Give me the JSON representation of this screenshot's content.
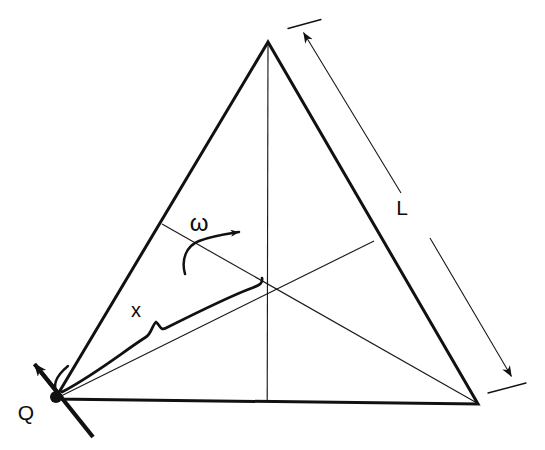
{
  "figure": {
    "background_color": "#ffffff",
    "ink_color": "#111111",
    "canvas": {
      "width": 545,
      "height": 450
    }
  },
  "labels": {
    "side_length": "L",
    "radial_distance": "x",
    "pivot_point": "Q",
    "angular_velocity": "ω"
  },
  "label_positions": {
    "side_length": {
      "x": 402,
      "y": 215
    },
    "radial_distance": {
      "x": 136,
      "y": 317
    },
    "pivot_point": {
      "x": 26,
      "y": 420
    },
    "angular_velocity": {
      "x": 199,
      "y": 231
    }
  },
  "geometry": {
    "triangle": {
      "name": "equilateral-plate",
      "stroke_width": 3.0,
      "vertices": [
        {
          "name": "apex",
          "x": 268,
          "y": 42
        },
        {
          "name": "bottom-left",
          "x": 55,
          "y": 399
        },
        {
          "name": "bottom-right",
          "x": 478,
          "y": 404
        }
      ]
    },
    "medians": {
      "stroke_width": 1.0,
      "centroid": {
        "x": 267,
        "y": 282
      },
      "lines": [
        {
          "name": "median-apex-to-base",
          "x1": 268,
          "y1": 42,
          "x2": 267,
          "y2": 401
        },
        {
          "name": "median-q-to-right",
          "x1": 55,
          "y1": 399,
          "x2": 374,
          "y2": 241
        },
        {
          "name": "median-left-to-right",
          "x1": 162,
          "y1": 224,
          "x2": 478,
          "y2": 404
        }
      ]
    },
    "pivot_marker": {
      "name": "pivot-dot",
      "x": 56,
      "y": 397,
      "radius": 6
    },
    "axis_line": {
      "name": "rotation-axis",
      "stroke_width": 4.0,
      "x1": 36,
      "y1": 366,
      "x2": 92,
      "y2": 436,
      "arrow_at": {
        "x": 30,
        "y": 359
      }
    },
    "angle_arc": {
      "name": "pivot-angle-arc",
      "stroke_width": 2.2
    },
    "dimension_L": {
      "name": "side-length-dimension",
      "stroke_width": 1.0,
      "upper_segment": {
        "x1": 302,
        "y1": 31,
        "x2": 401,
        "y2": 193
      },
      "lower_segment": {
        "x1": 430,
        "y1": 238,
        "x2": 512,
        "y2": 376
      },
      "tick_top": {
        "x1": 288,
        "y1": 28,
        "x2": 320,
        "y2": 20
      },
      "tick_bottom": {
        "x1": 489,
        "y1": 393,
        "x2": 525,
        "y2": 383
      },
      "arrow_top": {
        "x": 303,
        "y": 32
      },
      "arrow_bottom": {
        "x": 512,
        "y": 379
      }
    },
    "leader_x": {
      "name": "radial-distance-leader",
      "stroke_width": 2.6,
      "from": {
        "x": 66,
        "y": 389
      },
      "to": {
        "x": 258,
        "y": 292
      },
      "hook_peak": {
        "x": 262,
        "y": 279
      },
      "notch": {
        "x": 152,
        "y": 330
      }
    },
    "omega_arrow": {
      "name": "angular-velocity-arrow",
      "stroke_width": 2.4,
      "tail": {
        "x": 186,
        "y": 272
      },
      "head": {
        "x": 243,
        "y": 231
      }
    }
  }
}
